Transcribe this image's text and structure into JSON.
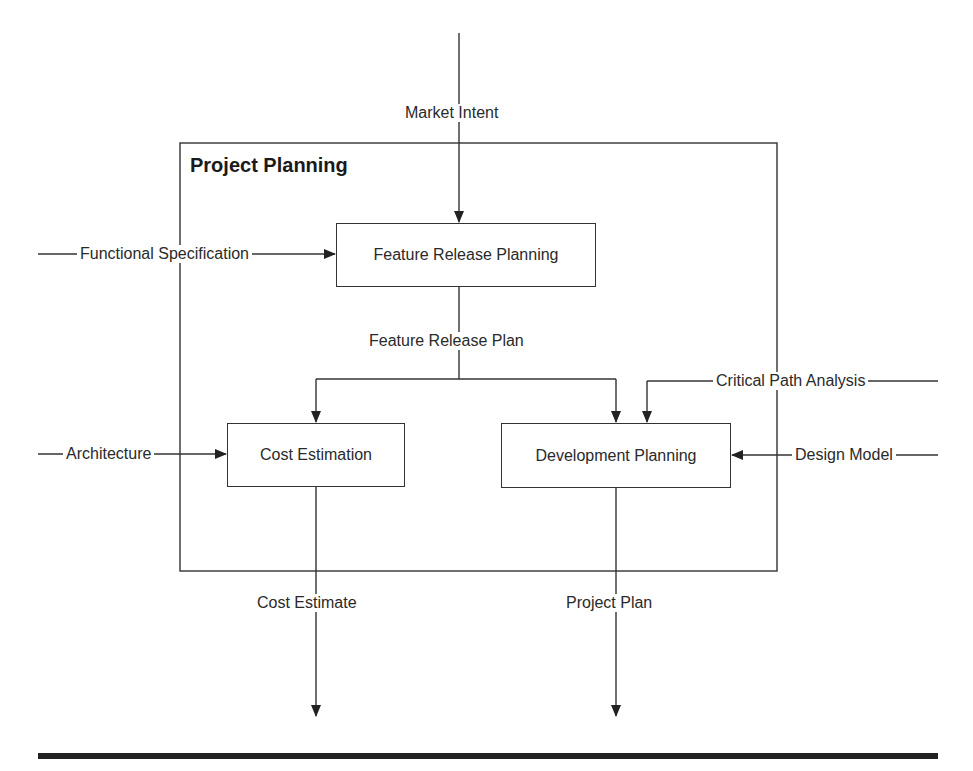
{
  "diagram": {
    "container": {
      "title": "Project Planning"
    },
    "processes": [
      {
        "id": "feature",
        "label": "Feature Release Planning"
      },
      {
        "id": "cost",
        "label": "Cost Estimation"
      },
      {
        "id": "dev",
        "label": "Development Planning"
      }
    ],
    "flows": {
      "market_intent": "Market Intent",
      "functional_spec": "Functional Specification",
      "feature_release_plan": "Feature Release Plan",
      "critical_path": "Critical Path Analysis",
      "architecture": "Architecture",
      "design_model": "Design Model",
      "cost_estimate": "Cost Estimate",
      "project_plan": "Project Plan"
    },
    "colors": {
      "line": "#333333",
      "rule": "#222222"
    }
  }
}
